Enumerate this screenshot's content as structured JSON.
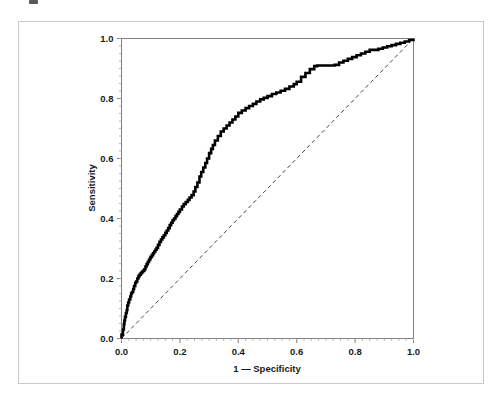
{
  "figure": {
    "background_color": "#ffffff",
    "border_color": "#c9c9c9",
    "axis_color": "#808080",
    "curve_color": "#000000",
    "reference_line_color": "#333333"
  },
  "chart_data": {
    "type": "line",
    "title": "",
    "subtitle": "",
    "xlabel": "1 — Specificity",
    "ylabel": "Sensitivity",
    "xlim": [
      0.0,
      1.0
    ],
    "ylim": [
      0.0,
      1.0
    ],
    "xticks": [
      0.0,
      0.2,
      0.4,
      0.6,
      0.8,
      1.0
    ],
    "yticks": [
      0.0,
      0.2,
      0.4,
      0.6,
      0.8,
      1.0
    ],
    "xticklabels": [
      "0.0",
      "0.2",
      "0.4",
      "0.6",
      "0.8",
      "1.0"
    ],
    "yticklabels": [
      "0.0",
      "0.2",
      "0.4",
      "0.6",
      "0.8",
      "1.0"
    ],
    "grid": false,
    "legend": null,
    "legend_position": "none",
    "annotations": [],
    "series": [
      {
        "name": "ROC curve",
        "style": "solid",
        "color": "#000000",
        "line_width": 2.6,
        "step": "staircase",
        "x": [
          0.0,
          0.0,
          0.005,
          0.008,
          0.01,
          0.012,
          0.015,
          0.018,
          0.02,
          0.023,
          0.026,
          0.03,
          0.033,
          0.036,
          0.04,
          0.043,
          0.047,
          0.05,
          0.054,
          0.058,
          0.062,
          0.066,
          0.07,
          0.074,
          0.078,
          0.082,
          0.086,
          0.09,
          0.094,
          0.098,
          0.1,
          0.104,
          0.108,
          0.112,
          0.116,
          0.12,
          0.125,
          0.13,
          0.135,
          0.14,
          0.145,
          0.15,
          0.155,
          0.16,
          0.165,
          0.17,
          0.175,
          0.18,
          0.185,
          0.19,
          0.195,
          0.2,
          0.207,
          0.213,
          0.22,
          0.227,
          0.233,
          0.24,
          0.247,
          0.253,
          0.26,
          0.267,
          0.273,
          0.28,
          0.287,
          0.293,
          0.3,
          0.307,
          0.313,
          0.32,
          0.33,
          0.34,
          0.35,
          0.36,
          0.37,
          0.38,
          0.39,
          0.4,
          0.412,
          0.425,
          0.437,
          0.45,
          0.462,
          0.475,
          0.487,
          0.5,
          0.515,
          0.53,
          0.545,
          0.56,
          0.575,
          0.59,
          0.6,
          0.615,
          0.63,
          0.645,
          0.66,
          0.67,
          0.69,
          0.71,
          0.73,
          0.745,
          0.76,
          0.775,
          0.79,
          0.805,
          0.82,
          0.835,
          0.85,
          0.865,
          0.88,
          0.895,
          0.91,
          0.925,
          0.94,
          0.955,
          0.97,
          0.985,
          1.0
        ],
        "y": [
          0.0,
          0.013,
          0.03,
          0.048,
          0.06,
          0.072,
          0.085,
          0.095,
          0.11,
          0.12,
          0.13,
          0.14,
          0.15,
          0.155,
          0.165,
          0.175,
          0.185,
          0.19,
          0.2,
          0.208,
          0.213,
          0.218,
          0.222,
          0.226,
          0.231,
          0.24,
          0.248,
          0.255,
          0.262,
          0.268,
          0.272,
          0.278,
          0.284,
          0.29,
          0.296,
          0.302,
          0.312,
          0.322,
          0.33,
          0.337,
          0.344,
          0.352,
          0.36,
          0.368,
          0.378,
          0.386,
          0.394,
          0.4,
          0.408,
          0.415,
          0.422,
          0.43,
          0.44,
          0.448,
          0.455,
          0.462,
          0.47,
          0.478,
          0.49,
          0.505,
          0.52,
          0.54,
          0.555,
          0.57,
          0.585,
          0.6,
          0.618,
          0.632,
          0.645,
          0.66,
          0.675,
          0.69,
          0.7,
          0.71,
          0.72,
          0.73,
          0.74,
          0.752,
          0.76,
          0.768,
          0.775,
          0.782,
          0.79,
          0.797,
          0.802,
          0.808,
          0.815,
          0.82,
          0.826,
          0.832,
          0.84,
          0.848,
          0.856,
          0.872,
          0.885,
          0.898,
          0.908,
          0.91,
          0.91,
          0.91,
          0.912,
          0.92,
          0.926,
          0.932,
          0.938,
          0.944,
          0.95,
          0.956,
          0.962,
          0.962,
          0.966,
          0.97,
          0.974,
          0.978,
          0.982,
          0.986,
          0.99,
          0.995,
          1.0
        ]
      },
      {
        "name": "Reference line",
        "style": "dashed",
        "color": "#333333",
        "line_width": 0.9,
        "x": [
          0.0,
          1.0
        ],
        "y": [
          0.0,
          1.0
        ]
      }
    ]
  }
}
